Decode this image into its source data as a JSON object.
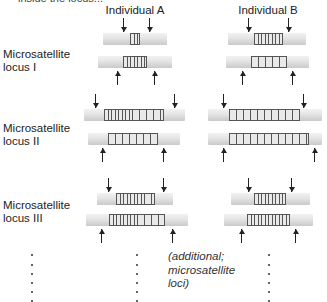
{
  "header": {
    "cut_text": "inside the locus...",
    "individual_a": "Individual A",
    "individual_b": "Individual B"
  },
  "loci": [
    {
      "label_line1": "Microsatellite",
      "label_line2": "locus I",
      "label_top": 48
    },
    {
      "label_line1": "Microsatellite",
      "label_line2": "locus II",
      "label_top": 122
    },
    {
      "label_line1": "Microsatellite",
      "label_line2": "locus III",
      "label_top": 199
    }
  ],
  "bars": [
    {
      "id": "I-A-1",
      "x": 103,
      "y": 33,
      "w": 64,
      "rx": 130,
      "rw": 10,
      "arrows": [
        123,
        149
      ],
      "dir": "down"
    },
    {
      "id": "I-A-2",
      "x": 98,
      "y": 56,
      "w": 74,
      "rx": 123,
      "rw": 24,
      "arrows": [
        117,
        154
      ],
      "dir": "up"
    },
    {
      "id": "I-B-1",
      "x": 228,
      "y": 33,
      "w": 78,
      "rx": 254,
      "rw": 29,
      "arrows": [
        248,
        288
      ],
      "dir": "down"
    },
    {
      "id": "I-B-2",
      "x": 226,
      "y": 56,
      "w": 83,
      "rx": 251,
      "rw": 36,
      "arrows": [
        242,
        292
      ],
      "dir": "up"
    },
    {
      "id": "II-A-1",
      "x": 84,
      "y": 109,
      "w": 101,
      "rx": 104,
      "rw": 60,
      "arrows": [
        95,
        174
      ],
      "dir": "down"
    },
    {
      "id": "II-A-2",
      "x": 88,
      "y": 133,
      "w": 92,
      "rx": 108,
      "rw": 50,
      "arrows": [
        102,
        163
      ],
      "dir": "up"
    },
    {
      "id": "II-B-1",
      "x": 208,
      "y": 109,
      "w": 114,
      "rx": 229,
      "rw": 71,
      "arrows": [
        223,
        303
      ],
      "dir": "down"
    },
    {
      "id": "II-B-2",
      "x": 208,
      "y": 133,
      "w": 114,
      "rx": 229,
      "rw": 80,
      "arrows": [
        223,
        314
      ],
      "dir": "up"
    },
    {
      "id": "III-A-1",
      "x": 97,
      "y": 193,
      "w": 76,
      "rx": 116,
      "rw": 39,
      "arrows": [
        108,
        163
      ],
      "dir": "down"
    },
    {
      "id": "III-A-2",
      "x": 86,
      "y": 214,
      "w": 102,
      "rx": 109,
      "rw": 56,
      "arrows": [
        101,
        172
      ],
      "dir": "up"
    },
    {
      "id": "III-B-1",
      "x": 231,
      "y": 193,
      "w": 79,
      "rx": 254,
      "rw": 32,
      "arrows": [
        248,
        291
      ],
      "dir": "down"
    },
    {
      "id": "III-B-2",
      "x": 224,
      "y": 214,
      "w": 89,
      "rx": 247,
      "rw": 43,
      "arrows": [
        241,
        295
      ],
      "dir": "up"
    }
  ],
  "continuation": {
    "dot_columns": [
      31,
      136,
      268
    ],
    "dot_rows": [
      254,
      264,
      273,
      282,
      291,
      300
    ],
    "note_line1": "(additional;",
    "note_line2": "microsatellite",
    "note_line3": "loci)"
  }
}
